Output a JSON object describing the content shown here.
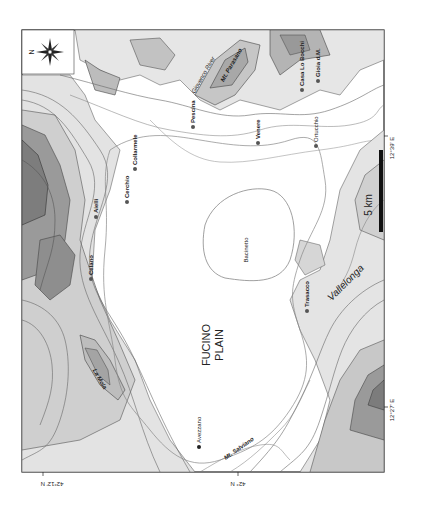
{
  "map": {
    "title_lines": [
      "FUCINO",
      "PLAIN"
    ],
    "compass": {
      "label": "N"
    },
    "scale_bar": {
      "label": "5 km",
      "tick_label": "n"
    },
    "coordinates": {
      "lat_left": "42°12' N",
      "lat_right": "42° N",
      "lon_top": "12°39' E",
      "lon_bottom": "12°27' E"
    },
    "towns": [
      {
        "name": "Avezzano"
      },
      {
        "name": "Celano"
      },
      {
        "name": "Aielli"
      },
      {
        "name": "Cerchio"
      },
      {
        "name": "Collarmele"
      },
      {
        "name": "Pescina"
      },
      {
        "name": "Venere"
      },
      {
        "name": "Casa Lo Bocchi"
      },
      {
        "name": "Gioia d.M."
      },
      {
        "name": "Ortucchio"
      },
      {
        "name": "Trasacco"
      }
    ],
    "features": {
      "basin": "Bacinetto",
      "river": "Giovenco River",
      "mt_parasano": "Mt. Parasano",
      "la_mola": "La Mola",
      "mt_salviano": "Mt. Salviano",
      "vallelonga": "Vallelonga"
    },
    "colors": {
      "frame": "#222222",
      "contour": "#555555",
      "relief_light": "#e6e6e6",
      "relief_mid": "#c4c4c4",
      "relief_dark": "#8c8c8c",
      "plain": "#ffffff"
    }
  }
}
